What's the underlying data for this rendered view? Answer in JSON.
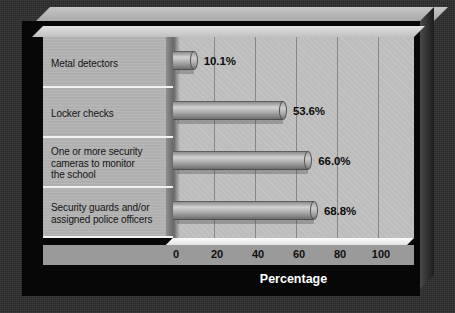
{
  "chart_data": {
    "type": "bar",
    "orientation": "horizontal",
    "title": "",
    "xlabel": "Percentage",
    "ylabel": "Security Measure",
    "xlim": [
      0,
      115
    ],
    "xticks": [
      0,
      20,
      40,
      60,
      80,
      100
    ],
    "xtick_labels": [
      "0",
      "20",
      "40",
      "60",
      "80",
      "100"
    ],
    "grid": true,
    "legend": false,
    "categories": [
      "Metal detectors",
      "Locker checks",
      "One or more security cameras to monitor the school",
      "Security guards and/or assigned police officers"
    ],
    "values": [
      10.1,
      53.6,
      66.0,
      68.8
    ],
    "value_labels": [
      "10.1%",
      "53.6%",
      "66.0%",
      "68.8%"
    ],
    "bar_style": "3d-cylinder",
    "colors": {
      "bar": "#b0b0b0",
      "plot_background": "#bdbdbd",
      "label_panel": "#b3b3b3",
      "card_background": "#070707",
      "outer_background": "#2e2e2e",
      "axis_text": "#101010",
      "title_text": "#ffffff"
    }
  },
  "categories_display": [
    {
      "line1": "Metal detectors",
      "line2": "",
      "line3": ""
    },
    {
      "line1": "Locker checks",
      "line2": "",
      "line3": ""
    },
    {
      "line1": "One or more security",
      "line2": "cameras to monitor",
      "line3": "the school"
    },
    {
      "line1": "Security guards and/or",
      "line2": "assigned police officers",
      "line3": ""
    }
  ],
  "axis": {
    "y_title": "Security Measure",
    "x_title": "Percentage",
    "ticks": [
      "0",
      "20",
      "40",
      "60",
      "80",
      "100"
    ]
  },
  "values": {
    "v0": "10.1%",
    "v1": "53.6%",
    "v2": "66.0%",
    "v3": "68.8%"
  }
}
